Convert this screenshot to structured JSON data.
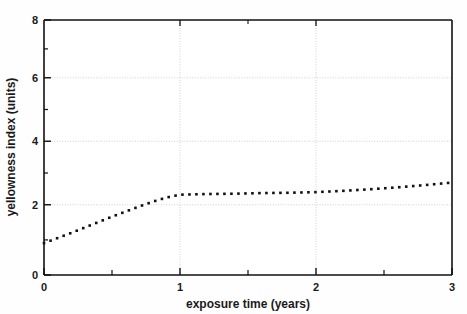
{
  "figure": {
    "background_color": "#fefefe",
    "cropped_title_fragment": "",
    "plot_area": {
      "left_px": 44,
      "top_px": 20,
      "right_px": 452,
      "bottom_px": 275
    }
  },
  "chart_data": {
    "type": "line",
    "title": "",
    "xlabel": "exposure time (years)",
    "ylabel": "yellowness index (units)",
    "xlim": [
      0,
      3
    ],
    "ylim": [
      0,
      8
    ],
    "xticks": [
      0,
      1,
      2,
      3
    ],
    "xtick_labels": [
      "0",
      "1",
      "2",
      "3"
    ],
    "x_minor_ticks": [
      0.5,
      1.5,
      2.5
    ],
    "yticks": [
      0,
      2,
      4,
      6,
      8
    ],
    "ytick_labels": [
      "0",
      "2",
      "4",
      "6",
      "8"
    ],
    "y_minor_ticks": [
      1,
      3,
      5,
      7
    ],
    "grid": true,
    "grid_style": "dotted",
    "grid_color": "#c8c8c8",
    "legend": null,
    "line_style": "dotted",
    "line_color": "#111111",
    "marker": "square",
    "series": [
      {
        "name": "yellowness index",
        "x": [
          0.0,
          0.1,
          0.2,
          0.3,
          0.4,
          0.5,
          0.6,
          0.7,
          0.8,
          0.9,
          1.0,
          1.2,
          1.4,
          1.6,
          1.8,
          2.0,
          2.2,
          2.4,
          2.6,
          2.8,
          3.0
        ],
        "values": [
          1.0,
          1.16,
          1.32,
          1.49,
          1.66,
          1.83,
          1.99,
          2.15,
          2.3,
          2.43,
          2.52,
          2.54,
          2.55,
          2.57,
          2.58,
          2.6,
          2.64,
          2.69,
          2.75,
          2.82,
          2.9
        ]
      }
    ],
    "annotations": []
  },
  "axis_titles": {
    "x": "exposure time (years)",
    "y": "yellowness index (units)"
  }
}
